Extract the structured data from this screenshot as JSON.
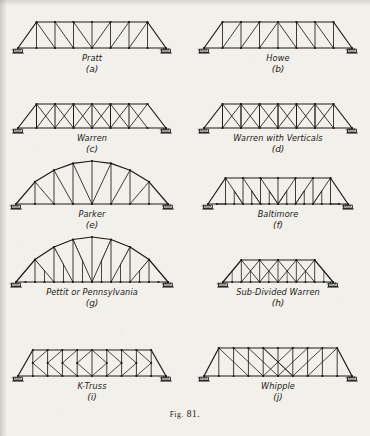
{
  "figure": {
    "caption_prefix": "Fig.",
    "caption_number": "81.",
    "caption_full": "Fig. 81."
  },
  "colors": {
    "ink": "#1a1a1a",
    "paper": "#f2f0ea",
    "hatch": "#3a3a3a"
  },
  "trusses": [
    {
      "id": "pratt",
      "name": "Pratt",
      "key": "(a)",
      "type": "pratt",
      "panels": 8,
      "span": 148,
      "depth": 26,
      "end_post": "inclined",
      "top_chord": "straight",
      "col": 0,
      "row": 0
    },
    {
      "id": "howe",
      "name": "Howe",
      "key": "(b)",
      "type": "howe",
      "panels": 8,
      "span": 148,
      "depth": 26,
      "end_post": "inclined",
      "top_chord": "straight",
      "col": 1,
      "row": 0
    },
    {
      "id": "warren",
      "name": "Warren",
      "key": "(c)",
      "type": "warren",
      "panels": 8,
      "span": 148,
      "depth": 24,
      "end_post": "inclined",
      "top_chord": "straight",
      "col": 0,
      "row": 1
    },
    {
      "id": "warren-verticals",
      "name": "Warren with Verticals",
      "key": "(d)",
      "type": "warren-verticals",
      "panels": 8,
      "span": 148,
      "depth": 24,
      "end_post": "inclined",
      "top_chord": "straight",
      "col": 1,
      "row": 1
    },
    {
      "id": "parker",
      "name": "Parker",
      "key": "(e)",
      "type": "pratt",
      "panels": 8,
      "span": 152,
      "depth": 30,
      "end_post": "inclined",
      "top_chord": "arched",
      "arch_rise": 13,
      "end_depth": 6,
      "col": 0,
      "row": 2
    },
    {
      "id": "baltimore",
      "name": "Baltimore",
      "key": "(f)",
      "type": "baltimore",
      "panels": 8,
      "span": 140,
      "depth": 26,
      "end_post": "inclined",
      "top_chord": "straight",
      "col": 1,
      "row": 2
    },
    {
      "id": "pettit",
      "name": "Pettit or Pennsylvania",
      "key": "(g)",
      "type": "pettit",
      "panels": 8,
      "span": 152,
      "depth": 30,
      "end_post": "inclined",
      "top_chord": "arched",
      "arch_rise": 15,
      "end_depth": 5,
      "col": 0,
      "row": 3
    },
    {
      "id": "sub-divided-warren",
      "name": "Sub-Divided Warren",
      "key": "(h)",
      "type": "subdivided-warren",
      "panels": 6,
      "span": 110,
      "depth": 22,
      "end_post": "inclined",
      "top_chord": "straight",
      "col": 1,
      "row": 3
    },
    {
      "id": "k-truss",
      "name": "K-Truss",
      "key": "(i)",
      "type": "k-truss",
      "panels": 10,
      "span": 148,
      "depth": 26,
      "end_post": "inclined",
      "top_chord": "straight",
      "col": 0,
      "row": 4
    },
    {
      "id": "whipple",
      "name": "Whipple",
      "key": "(j)",
      "type": "whipple",
      "panels": 10,
      "span": 148,
      "depth": 28,
      "end_post": "inclined",
      "top_chord": "straight",
      "col": 1,
      "row": 4
    }
  ]
}
